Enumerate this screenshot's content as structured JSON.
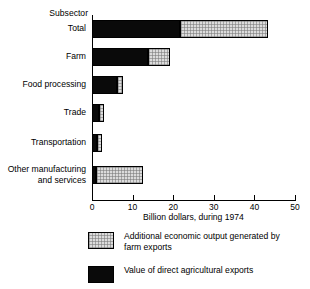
{
  "chart_data": {
    "type": "bar",
    "orientation": "horizontal",
    "stacked": true,
    "title": "",
    "axis_header": "Subsector",
    "xlabel": "Billion dollars, during 1974",
    "ylabel": "",
    "xlim": [
      0,
      50
    ],
    "xticks": [
      0,
      10,
      20,
      30,
      40,
      50
    ],
    "xticklabels": [
      "0",
      "10",
      "20",
      "30",
      "40",
      "50"
    ],
    "grid": false,
    "categories": [
      "Total",
      "Farm",
      "Food processing",
      "Trade",
      "Transportation",
      "Other manufacturing\nand services"
    ],
    "series": [
      {
        "name": "Value of direct agricultural exports",
        "key": "direct",
        "color": "#0a0a0a",
        "values": [
          21.7,
          13.8,
          6.2,
          1.7,
          1.3,
          1.0
        ]
      },
      {
        "name": "Additional economic output generated by\nfarm exports",
        "key": "additional",
        "color": "#dcdcdc",
        "values": [
          21.6,
          5.4,
          1.4,
          1.3,
          1.2,
          11.5
        ]
      }
    ],
    "totals": [
      43.3,
      19.2,
      7.6,
      3.0,
      2.5,
      12.5
    ],
    "legend": {
      "position": "bottom",
      "entries": [
        {
          "swatch": "light",
          "label": "Additional economic output generated by\nfarm exports"
        },
        {
          "swatch": "dark",
          "label": "Value of direct agricultural exports"
        }
      ]
    }
  }
}
